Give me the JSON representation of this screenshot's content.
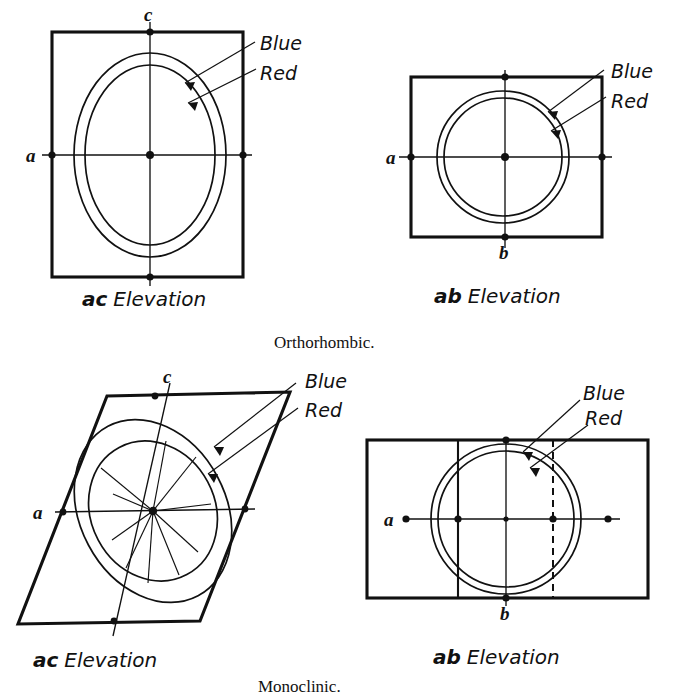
{
  "figure": {
    "background_color": "#ffffff",
    "ink_color": "#111111",
    "panels": [
      {
        "id": "orthorhombic-ac",
        "caption": "ac Elevation",
        "caption_italic_prefix": "ac",
        "caption_rest": " Elevation",
        "outline_shape": "rectangle",
        "axis_labels": [
          {
            "name": "c",
            "text": "c",
            "position": "top"
          },
          {
            "name": "a",
            "text": "a",
            "position": "left"
          }
        ],
        "callouts": [
          {
            "name": "blue",
            "text": "Blue",
            "color_name": "blue"
          },
          {
            "name": "red",
            "text": "Red",
            "color_name": "red"
          }
        ],
        "curves": [
          "outer-ellipse",
          "inner-ellipse"
        ]
      },
      {
        "id": "orthorhombic-ab",
        "caption": "ab Elevation",
        "caption_italic_prefix": "ab",
        "caption_rest": " Elevation",
        "outline_shape": "rectangle",
        "axis_labels": [
          {
            "name": "a",
            "text": "a",
            "position": "left"
          },
          {
            "name": "b",
            "text": "b",
            "position": "bottom"
          }
        ],
        "callouts": [
          {
            "name": "blue",
            "text": "Blue",
            "color_name": "blue"
          },
          {
            "name": "red",
            "text": "Red",
            "color_name": "red"
          }
        ],
        "curves": [
          "outer-circle",
          "inner-circle"
        ]
      },
      {
        "id": "monoclinic-ac",
        "caption": "ac Elevation",
        "caption_italic_prefix": "ac",
        "caption_rest": " Elevation",
        "outline_shape": "parallelogram",
        "axis_labels": [
          {
            "name": "c",
            "text": "c",
            "position": "top"
          },
          {
            "name": "a",
            "text": "a",
            "position": "left"
          }
        ],
        "callouts": [
          {
            "name": "blue",
            "text": "Blue",
            "color_name": "blue"
          },
          {
            "name": "red",
            "text": "Red",
            "color_name": "red"
          }
        ],
        "curves": [
          "outer-ellipse-tilted",
          "inner-ellipse-tilted",
          "radial-rays"
        ]
      },
      {
        "id": "monoclinic-ab",
        "caption": "ab Elevation",
        "caption_italic_prefix": "ab",
        "caption_rest": " Elevation",
        "outline_shape": "rectangle",
        "axis_labels": [
          {
            "name": "a",
            "text": "a",
            "position": "left"
          },
          {
            "name": "b",
            "text": "b",
            "position": "bottom"
          }
        ],
        "callouts": [
          {
            "name": "blue",
            "text": "Blue",
            "color_name": "blue"
          },
          {
            "name": "red",
            "text": "Red",
            "color_name": "red"
          }
        ],
        "curves": [
          "outer-circle",
          "inner-circle",
          "solid-vertical-trace",
          "dashed-vertical-trace"
        ]
      }
    ],
    "system_captions": [
      {
        "name": "orthorhombic",
        "text": "Orthorhombic."
      },
      {
        "name": "monoclinic",
        "text": "Monoclinic."
      }
    ]
  },
  "labels": {
    "blue": "Blue",
    "red": "Red",
    "a": "a",
    "b": "b",
    "c": "c",
    "ac_prefix": "ac",
    "ab_prefix": "ab",
    "elevation_suffix": "Elevation",
    "orthorhombic": "Orthorhombic.",
    "monoclinic": "Monoclinic."
  }
}
